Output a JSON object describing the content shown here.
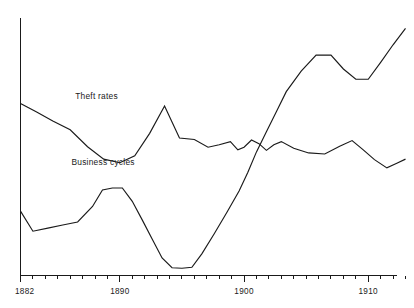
{
  "chart_data": {
    "type": "line",
    "title": "",
    "subtitle": "",
    "xlabel": "",
    "ylabel": "",
    "xlim": [
      1882,
      1913
    ],
    "ylim": [
      0,
      100
    ],
    "grid": false,
    "legend_position": "inline-labels",
    "x_tick_labels": [
      "1882",
      "1890",
      "1900",
      "1910"
    ],
    "x_tick_label_values": [
      1882,
      1890,
      1900,
      1910
    ],
    "x_minor_tick_values": [
      1883,
      1884,
      1885,
      1886,
      1887,
      1888,
      1889,
      1891,
      1892,
      1893,
      1894,
      1895,
      1896,
      1897,
      1898,
      1899,
      1901,
      1902,
      1903,
      1904,
      1905,
      1906,
      1907,
      1908,
      1909,
      1911,
      1912,
      1913
    ],
    "y_axis_ticks": [],
    "series": [
      {
        "name": "Theft rates",
        "label": "Theft rates",
        "label_x": 1886.4,
        "label_y": 68.5,
        "color": "#1a1a1a",
        "x": [
          1882,
          1883.3,
          1884.6,
          1886.0,
          1887.4,
          1888.7,
          1890.0,
          1891.2,
          1892.4,
          1893.6,
          1894.8,
          1896.0,
          1897.1,
          1898.0,
          1898.9,
          1899.5,
          1900.0,
          1900.6,
          1901.2,
          1901.8,
          1902.4,
          1903.0,
          1904.0,
          1905.2,
          1906.5,
          1907.7,
          1908.7,
          1909.6,
          1910.5,
          1911.5,
          1912.3,
          1913.0
        ],
        "values": [
          66.8,
          63.5,
          60.0,
          56.6,
          50.0,
          45.2,
          43.8,
          46.5,
          55.2,
          65.8,
          53.4,
          52.8,
          49.8,
          50.8,
          52.0,
          48.8,
          49.8,
          52.6,
          51.2,
          48.6,
          50.8,
          52.0,
          49.4,
          47.6,
          47.2,
          50.2,
          52.4,
          48.8,
          45.0,
          41.8,
          43.6,
          45.2
        ]
      },
      {
        "name": "Business cycles",
        "label": "Business cycles",
        "label_x": 1886.1,
        "label_y": 43.0,
        "color": "#1a1a1a",
        "x": [
          1882,
          1883.0,
          1884.2,
          1885.4,
          1886.6,
          1887.8,
          1888.6,
          1889.4,
          1890.2,
          1891.0,
          1891.8,
          1892.6,
          1893.4,
          1894.2,
          1895.0,
          1895.8,
          1896.6,
          1897.6,
          1898.6,
          1899.6,
          1900.3,
          1901.0,
          1901.8,
          1902.6,
          1903.4,
          1904.6,
          1905.8,
          1907.0,
          1908.0,
          1909.0,
          1910.0,
          1911.0,
          1912.0,
          1913.0
        ],
        "values": [
          25.0,
          17.2,
          18.4,
          19.6,
          20.8,
          26.8,
          33.2,
          34.0,
          34.0,
          28.8,
          21.6,
          14.2,
          6.8,
          3.0,
          2.8,
          3.2,
          8.4,
          16.2,
          24.4,
          32.8,
          40.0,
          48.0,
          55.8,
          63.6,
          71.4,
          79.4,
          85.6,
          85.6,
          80.2,
          76.2,
          76.2,
          82.8,
          89.6,
          96.0
        ]
      }
    ]
  }
}
